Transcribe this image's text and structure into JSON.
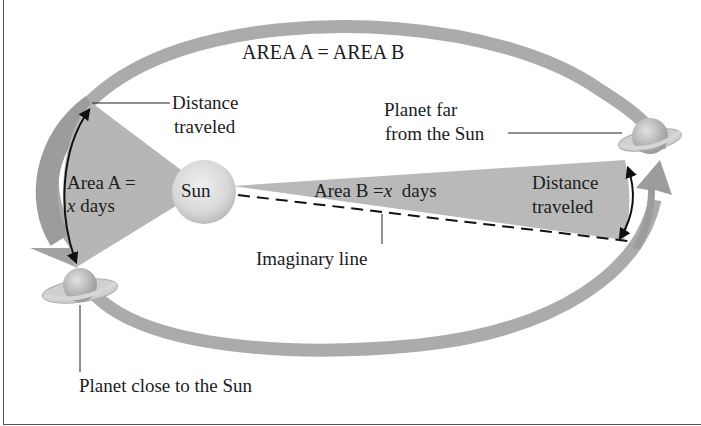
{
  "diagram": {
    "title": "AREA A = AREA B",
    "sun_label": "Sun",
    "area_a": {
      "line1": "Area A =",
      "line2_var": "x",
      "line2_rest": " days"
    },
    "area_b": {
      "prefix": "Area B =",
      "var": "x",
      "rest": "  days"
    },
    "distance_left": {
      "line1": "Distance",
      "line2": "traveled"
    },
    "distance_right": {
      "line1": "Distance",
      "line2": "traveled"
    },
    "planet_far": {
      "line1": "Planet far",
      "line2": "from the Sun"
    },
    "planet_close": "Planet close to the Sun",
    "imaginary_line": "Imaginary line",
    "colors": {
      "orbit": "#a9a9a9",
      "area_fill": "#b9b9b9",
      "sun": "#dcdcdc",
      "planet": "#c8c8c8",
      "text": "#1c1c1c"
    }
  }
}
